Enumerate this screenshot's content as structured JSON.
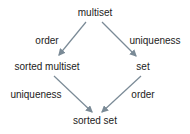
{
  "diagram": {
    "nodes": [
      {
        "id": "multiset",
        "label": "multiset",
        "x": 95,
        "y": 13
      },
      {
        "id": "sorted_multiset",
        "label": "sorted multiset",
        "x": 47,
        "y": 67
      },
      {
        "id": "set",
        "label": "set",
        "x": 143,
        "y": 67
      },
      {
        "id": "sorted_set",
        "label": "sorted set",
        "x": 95,
        "y": 121
      }
    ],
    "edges": [
      {
        "from": "multiset",
        "to": "sorted_multiset",
        "label": "order",
        "lx": 47,
        "ly": 41
      },
      {
        "from": "multiset",
        "to": "set",
        "label": "uniqueness",
        "lx": 155,
        "ly": 41
      },
      {
        "from": "sorted_multiset",
        "to": "sorted_set",
        "label": "uniqueness",
        "lx": 36,
        "ly": 95
      },
      {
        "from": "set",
        "to": "sorted_set",
        "label": "order",
        "lx": 143,
        "ly": 95
      }
    ],
    "arrow_color": "#7a8a96"
  }
}
